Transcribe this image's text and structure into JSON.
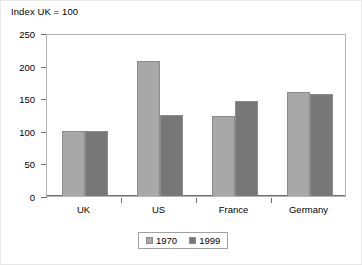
{
  "chart_data": {
    "type": "bar",
    "title": "Index UK = 100",
    "xlabel": "",
    "ylabel": "",
    "ylim": [
      0,
      250
    ],
    "yticks": [
      0,
      50,
      100,
      150,
      200,
      250
    ],
    "ytick_labels": [
      "0",
      "50",
      "100",
      "150",
      "200",
      "250"
    ],
    "grid": false,
    "legend_position": "bottom-center",
    "categories": [
      "UK",
      "US",
      "France",
      "Germany"
    ],
    "series": [
      {
        "name": "1970",
        "color": "#a8a8a8",
        "values": [
          100,
          207,
          122,
          159
        ]
      },
      {
        "name": "1999",
        "color": "#777777",
        "values": [
          100,
          124,
          145,
          157
        ]
      }
    ]
  },
  "legend": {
    "items": [
      {
        "label": "1970",
        "color": "#a8a8a8"
      },
      {
        "label": "1999",
        "color": "#777777"
      }
    ]
  }
}
